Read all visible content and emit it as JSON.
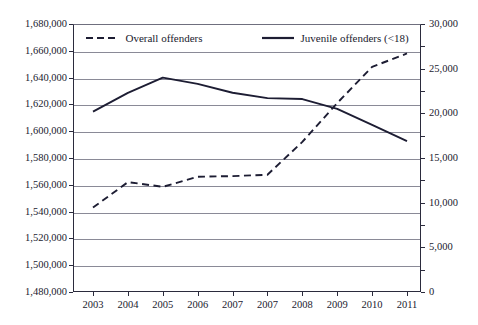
{
  "chart_data": {
    "type": "line",
    "title": "",
    "subtitle": "",
    "xlabel": "",
    "ylabel": "",
    "grid": true,
    "legend_position": "top-inside",
    "x": [
      "2003",
      "2004",
      "2005",
      "2006",
      "2007",
      "2007",
      "2008",
      "2009",
      "2010",
      "2011"
    ],
    "x_tick_labels": [
      "2003",
      "2004",
      "2005",
      "2006",
      "2007",
      "2007",
      "2008",
      "2009",
      "2010",
      "2011"
    ],
    "axes": {
      "left": {
        "label": "",
        "min": 1480000,
        "max": 1680000,
        "step": 20000,
        "tick_labels": [
          "1,680,000",
          "1,660,000",
          "1,640,000",
          "1,620,000",
          "1,600,000",
          "1,580,000",
          "1,560,000",
          "1,540,000",
          "1,520,000",
          "1,500,000",
          "1,480,000"
        ]
      },
      "right": {
        "label": "",
        "min": 0,
        "max": 30000,
        "step": 5000,
        "minor_step": 2500,
        "tick_labels": [
          "30,000",
          "25,000",
          "20,000",
          "15,000",
          "10,000",
          "5,000",
          "0"
        ]
      }
    },
    "series": [
      {
        "name": "Overall offenders",
        "axis": "left",
        "style": "dashed",
        "color": "#1d1d33",
        "values": [
          1543000,
          1562000,
          1558500,
          1566000,
          1566500,
          1567500,
          1592000,
          1621000,
          1648000,
          1658000
        ]
      },
      {
        "name": "Juvenile offenders (<18)",
        "axis": "right",
        "style": "solid",
        "color": "#1d1d33",
        "values": [
          20200,
          22300,
          24000,
          23300,
          22300,
          21700,
          21600,
          20500,
          18700,
          16900
        ]
      }
    ]
  },
  "legend": {
    "items": [
      {
        "label": "Overall offenders",
        "style": "dashed"
      },
      {
        "label": "Juvenile offenders (<18)",
        "style": "solid"
      }
    ]
  },
  "colors": {
    "series_ink": "#1d1d33",
    "gridline": "#8a8a97",
    "axis": "#2b2b3d",
    "background": "#ffffff",
    "text": "#1a1a2e"
  }
}
